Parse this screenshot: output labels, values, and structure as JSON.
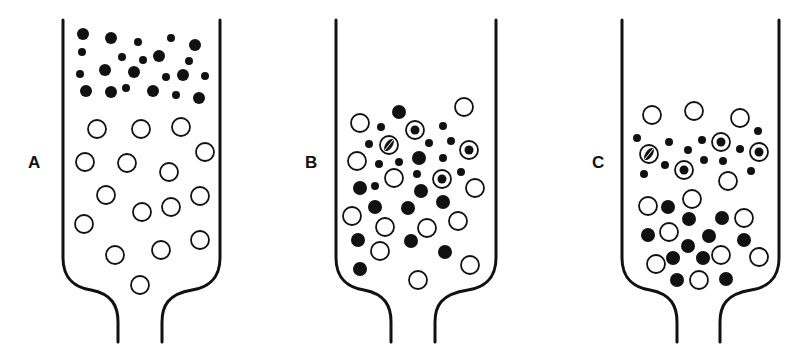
{
  "figure": {
    "type": "column-separation-diagram",
    "colors": {
      "ink": "#111111",
      "background": "#ffffff"
    },
    "legend_semantics": {
      "solid-large": "large dark particle",
      "solid-small": "small dark particle",
      "open": "open (hollow) bead",
      "ringed": "bead containing dark particle",
      "hatched": "bead with hatched/partially filled interior"
    },
    "panels": [
      {
        "label": "A",
        "label_pos": [
          34,
          163
        ],
        "vessel": {
          "left": 63,
          "right": 220,
          "top": 20,
          "neck_left": 118,
          "neck_right": 162,
          "bottom": 342
        },
        "particles": [
          {
            "t": "solid",
            "x": 83,
            "y": 34,
            "r": 6
          },
          {
            "t": "solid",
            "x": 111,
            "y": 38,
            "r": 6
          },
          {
            "t": "solid-small",
            "x": 138,
            "y": 42,
            "r": 4
          },
          {
            "t": "solid-small",
            "x": 171,
            "y": 38,
            "r": 4
          },
          {
            "t": "solid",
            "x": 195,
            "y": 45,
            "r": 6
          },
          {
            "t": "solid-small",
            "x": 82,
            "y": 52,
            "r": 4
          },
          {
            "t": "solid-small",
            "x": 122,
            "y": 57,
            "r": 4
          },
          {
            "t": "solid-small",
            "x": 143,
            "y": 60,
            "r": 4
          },
          {
            "t": "solid",
            "x": 159,
            "y": 56,
            "r": 6
          },
          {
            "t": "solid-small",
            "x": 189,
            "y": 61,
            "r": 4
          },
          {
            "t": "solid-small",
            "x": 80,
            "y": 74,
            "r": 4
          },
          {
            "t": "solid",
            "x": 105,
            "y": 70,
            "r": 6
          },
          {
            "t": "solid",
            "x": 134,
            "y": 72,
            "r": 6
          },
          {
            "t": "solid-small",
            "x": 166,
            "y": 77,
            "r": 4
          },
          {
            "t": "solid",
            "x": 183,
            "y": 75,
            "r": 6
          },
          {
            "t": "solid-small",
            "x": 205,
            "y": 76,
            "r": 4
          },
          {
            "t": "solid",
            "x": 86,
            "y": 91,
            "r": 6
          },
          {
            "t": "solid",
            "x": 111,
            "y": 92,
            "r": 6
          },
          {
            "t": "solid-small",
            "x": 126,
            "y": 88,
            "r": 4
          },
          {
            "t": "solid",
            "x": 153,
            "y": 91,
            "r": 6
          },
          {
            "t": "solid-small",
            "x": 176,
            "y": 95,
            "r": 4
          },
          {
            "t": "solid",
            "x": 199,
            "y": 98,
            "r": 6
          },
          {
            "t": "open",
            "x": 97,
            "y": 129,
            "r": 9
          },
          {
            "t": "open",
            "x": 141,
            "y": 129,
            "r": 9
          },
          {
            "t": "open",
            "x": 181,
            "y": 127,
            "r": 9
          },
          {
            "t": "open",
            "x": 85,
            "y": 162,
            "r": 9
          },
          {
            "t": "open",
            "x": 127,
            "y": 163,
            "r": 9
          },
          {
            "t": "open",
            "x": 205,
            "y": 152,
            "r": 9
          },
          {
            "t": "open",
            "x": 169,
            "y": 172,
            "r": 9
          },
          {
            "t": "open",
            "x": 106,
            "y": 195,
            "r": 9
          },
          {
            "t": "open",
            "x": 142,
            "y": 212,
            "r": 9
          },
          {
            "t": "open",
            "x": 171,
            "y": 207,
            "r": 9
          },
          {
            "t": "open",
            "x": 200,
            "y": 196,
            "r": 9
          },
          {
            "t": "open",
            "x": 84,
            "y": 224,
            "r": 9
          },
          {
            "t": "open",
            "x": 115,
            "y": 255,
            "r": 9
          },
          {
            "t": "open",
            "x": 161,
            "y": 250,
            "r": 9
          },
          {
            "t": "open",
            "x": 200,
            "y": 240,
            "r": 9
          },
          {
            "t": "open",
            "x": 140,
            "y": 285,
            "r": 9
          }
        ]
      },
      {
        "label": "B",
        "label_pos": [
          311,
          163
        ],
        "vessel": {
          "left": 336,
          "right": 496,
          "top": 20,
          "neck_left": 391,
          "neck_right": 435,
          "bottom": 342
        },
        "particles": [
          {
            "t": "solid",
            "x": 399,
            "y": 112,
            "r": 7
          },
          {
            "t": "open",
            "x": 464,
            "y": 107,
            "r": 9
          },
          {
            "t": "open",
            "x": 360,
            "y": 123,
            "r": 9
          },
          {
            "t": "solid-small",
            "x": 381,
            "y": 127,
            "r": 4
          },
          {
            "t": "ringed",
            "x": 415,
            "y": 130,
            "r": 9
          },
          {
            "t": "solid-small",
            "x": 443,
            "y": 126,
            "r": 4
          },
          {
            "t": "solid-small",
            "x": 369,
            "y": 144,
            "r": 4
          },
          {
            "t": "hatched",
            "x": 389,
            "y": 145,
            "r": 9
          },
          {
            "t": "solid-small",
            "x": 429,
            "y": 143,
            "r": 4
          },
          {
            "t": "solid-small",
            "x": 451,
            "y": 141,
            "r": 4
          },
          {
            "t": "ringed",
            "x": 469,
            "y": 150,
            "r": 9
          },
          {
            "t": "open",
            "x": 357,
            "y": 161,
            "r": 9
          },
          {
            "t": "solid-small",
            "x": 379,
            "y": 164,
            "r": 4
          },
          {
            "t": "solid-small",
            "x": 399,
            "y": 162,
            "r": 4
          },
          {
            "t": "solid",
            "x": 419,
            "y": 158,
            "r": 7
          },
          {
            "t": "solid-small",
            "x": 443,
            "y": 158,
            "r": 4
          },
          {
            "t": "open",
            "x": 394,
            "y": 178,
            "r": 9
          },
          {
            "t": "solid-small",
            "x": 417,
            "y": 174,
            "r": 4
          },
          {
            "t": "ringed",
            "x": 442,
            "y": 179,
            "r": 9
          },
          {
            "t": "solid-small",
            "x": 461,
            "y": 172,
            "r": 4
          },
          {
            "t": "open",
            "x": 475,
            "y": 188,
            "r": 9
          },
          {
            "t": "solid",
            "x": 360,
            "y": 188,
            "r": 7
          },
          {
            "t": "solid-small",
            "x": 375,
            "y": 186,
            "r": 4
          },
          {
            "t": "solid",
            "x": 421,
            "y": 191,
            "r": 7
          },
          {
            "t": "solid",
            "x": 375,
            "y": 207,
            "r": 7
          },
          {
            "t": "solid",
            "x": 408,
            "y": 208,
            "r": 7
          },
          {
            "t": "solid",
            "x": 443,
            "y": 202,
            "r": 7
          },
          {
            "t": "open",
            "x": 352,
            "y": 216,
            "r": 9
          },
          {
            "t": "open",
            "x": 385,
            "y": 227,
            "r": 9
          },
          {
            "t": "open",
            "x": 427,
            "y": 228,
            "r": 9
          },
          {
            "t": "open",
            "x": 458,
            "y": 221,
            "r": 9
          },
          {
            "t": "solid",
            "x": 358,
            "y": 240,
            "r": 7
          },
          {
            "t": "solid",
            "x": 411,
            "y": 241,
            "r": 7
          },
          {
            "t": "open",
            "x": 380,
            "y": 251,
            "r": 9
          },
          {
            "t": "solid",
            "x": 445,
            "y": 252,
            "r": 7
          },
          {
            "t": "solid",
            "x": 360,
            "y": 269,
            "r": 7
          },
          {
            "t": "open",
            "x": 418,
            "y": 280,
            "r": 9
          },
          {
            "t": "open",
            "x": 470,
            "y": 265,
            "r": 9
          }
        ]
      },
      {
        "label": "C",
        "label_pos": [
          598,
          163
        ],
        "vessel": {
          "left": 622,
          "right": 779,
          "top": 20,
          "neck_left": 677,
          "neck_right": 720,
          "bottom": 342
        },
        "particles": [
          {
            "t": "open",
            "x": 652,
            "y": 115,
            "r": 9
          },
          {
            "t": "open",
            "x": 694,
            "y": 111,
            "r": 9
          },
          {
            "t": "open",
            "x": 740,
            "y": 118,
            "r": 9
          },
          {
            "t": "solid-small",
            "x": 637,
            "y": 138,
            "r": 4
          },
          {
            "t": "solid-small",
            "x": 669,
            "y": 142,
            "r": 4
          },
          {
            "t": "solid-small",
            "x": 702,
            "y": 140,
            "r": 4
          },
          {
            "t": "ringed",
            "x": 721,
            "y": 142,
            "r": 9
          },
          {
            "t": "solid-small",
            "x": 758,
            "y": 131,
            "r": 4
          },
          {
            "t": "hatched",
            "x": 649,
            "y": 154,
            "r": 9
          },
          {
            "t": "solid-small",
            "x": 688,
            "y": 150,
            "r": 4
          },
          {
            "t": "solid-small",
            "x": 740,
            "y": 149,
            "r": 4
          },
          {
            "t": "ringed",
            "x": 759,
            "y": 152,
            "r": 9
          },
          {
            "t": "solid-small",
            "x": 665,
            "y": 165,
            "r": 4
          },
          {
            "t": "ringed",
            "x": 684,
            "y": 170,
            "r": 9
          },
          {
            "t": "solid-small",
            "x": 704,
            "y": 160,
            "r": 4
          },
          {
            "t": "solid-small",
            "x": 723,
            "y": 161,
            "r": 4
          },
          {
            "t": "solid-small",
            "x": 751,
            "y": 171,
            "r": 4
          },
          {
            "t": "solid-small",
            "x": 644,
            "y": 174,
            "r": 4
          },
          {
            "t": "open",
            "x": 728,
            "y": 181,
            "r": 9
          },
          {
            "t": "open",
            "x": 648,
            "y": 206,
            "r": 9
          },
          {
            "t": "solid",
            "x": 668,
            "y": 207,
            "r": 7
          },
          {
            "t": "open",
            "x": 692,
            "y": 199,
            "r": 9
          },
          {
            "t": "solid",
            "x": 689,
            "y": 219,
            "r": 7
          },
          {
            "t": "solid",
            "x": 722,
            "y": 218,
            "r": 7
          },
          {
            "t": "open",
            "x": 744,
            "y": 218,
            "r": 9
          },
          {
            "t": "solid",
            "x": 648,
            "y": 235,
            "r": 7
          },
          {
            "t": "open",
            "x": 669,
            "y": 232,
            "r": 9
          },
          {
            "t": "solid",
            "x": 709,
            "y": 236,
            "r": 7
          },
          {
            "t": "solid",
            "x": 744,
            "y": 240,
            "r": 7
          },
          {
            "t": "solid",
            "x": 688,
            "y": 246,
            "r": 7
          },
          {
            "t": "open",
            "x": 656,
            "y": 264,
            "r": 9
          },
          {
            "t": "solid",
            "x": 673,
            "y": 258,
            "r": 7
          },
          {
            "t": "solid",
            "x": 703,
            "y": 258,
            "r": 7
          },
          {
            "t": "open",
            "x": 721,
            "y": 255,
            "r": 9
          },
          {
            "t": "open",
            "x": 759,
            "y": 257,
            "r": 9
          },
          {
            "t": "solid",
            "x": 677,
            "y": 280,
            "r": 7
          },
          {
            "t": "open",
            "x": 699,
            "y": 280,
            "r": 9
          },
          {
            "t": "solid",
            "x": 726,
            "y": 279,
            "r": 7
          }
        ]
      }
    ]
  }
}
